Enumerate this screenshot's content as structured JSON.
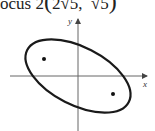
{
  "caption": {
    "prefix": "ocus 2",
    "open_paren": "(",
    "x_coord": "2√5,",
    "y_coord": "√5",
    "close_paren": ")"
  },
  "diagram": {
    "x_axis_label": "x",
    "y_axis_label": "y",
    "shape": "ellipse",
    "foci_count": 2,
    "colors": {
      "stroke": "#1a1a1a",
      "axis": "#555555",
      "background": "#ffffff"
    }
  }
}
